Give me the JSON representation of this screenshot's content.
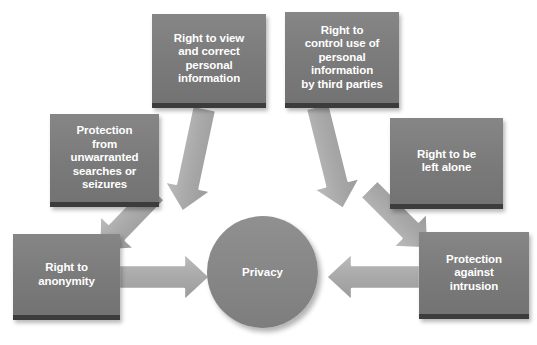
{
  "diagram": {
    "title_center": "Privacy",
    "background_color": "#ffffff",
    "box_color": "#7b7b7b",
    "box_shadow_color": "#3c3c3c",
    "circle_color": "#878787",
    "arrow_color": "#a9a9a9",
    "arrow_outline_color": "#ffffff",
    "text_color": "#ffffff",
    "nodes": [
      {
        "id": "view-correct",
        "label": "Right to view\nand correct\npersonal\ninformation"
      },
      {
        "id": "control-use",
        "label": "Right to\ncontrol use of\npersonal\ninformation\nby third parties"
      },
      {
        "id": "unwarranted-searches",
        "label": "Protection\nfrom\nunwarranted\nsearches or\nseizures"
      },
      {
        "id": "left-alone",
        "label": "Right to be\nleft alone"
      },
      {
        "id": "anonymity",
        "label": "Right to\nanonymity"
      },
      {
        "id": "intrusion",
        "label": "Protection\nagainst\nintrusion"
      }
    ]
  }
}
